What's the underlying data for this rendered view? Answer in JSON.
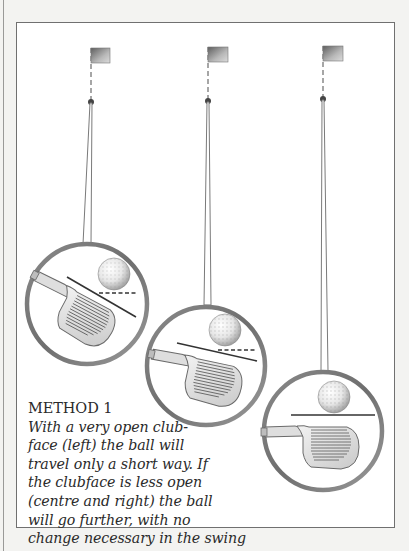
{
  "page": {
    "background": "#f3f3f1",
    "panel_border": "#707070"
  },
  "illustration": {
    "title": "Golf clubface angle illustration",
    "stages": [
      {
        "position": "left",
        "flag_x": 90,
        "hole_y": 101,
        "circle": {
          "cx": 86,
          "cy": 303,
          "r": 62
        },
        "clubface": "very open",
        "face_angle_deg": 28
      },
      {
        "position": "centre",
        "flag_x": 207,
        "hole_y": 100,
        "circle": {
          "cx": 205,
          "cy": 365,
          "r": 61
        },
        "clubface": "less open",
        "face_angle_deg": 12
      },
      {
        "position": "right",
        "flag_x": 322,
        "hole_y": 98,
        "circle": {
          "cx": 322,
          "cy": 430,
          "r": 61
        },
        "clubface": "square",
        "face_angle_deg": 0
      }
    ]
  },
  "caption": {
    "heading": "METHOD 1",
    "lines": [
      "With a very open club-",
      "face (left) the ball will",
      "travel only a short way. If",
      "the clubface is less open",
      "(centre and right) the ball",
      "will go further, with no",
      "change necessary in the swing"
    ]
  }
}
